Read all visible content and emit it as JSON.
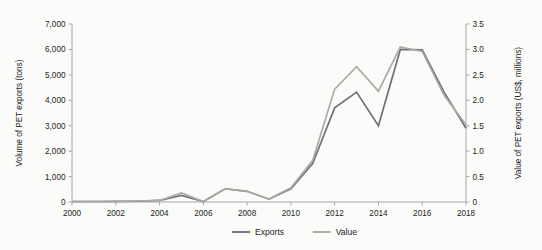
{
  "chart_data": {
    "type": "line",
    "title": "",
    "subtitle": "",
    "xlabel": "",
    "ylabel": "Volume of PET exports (tons)",
    "y2label": "Value of PET exports (US$, millions)",
    "grid": false,
    "legend_position": "bottom-center",
    "xlim": [
      2000,
      2018
    ],
    "ylim": [
      0,
      7000
    ],
    "y2lim": [
      0,
      3.5
    ],
    "x": [
      2000,
      2001,
      2002,
      2003,
      2004,
      2005,
      2006,
      2007,
      2008,
      2009,
      2010,
      2011,
      2012,
      2013,
      2014,
      2015,
      2016,
      2017,
      2018
    ],
    "xticks": [
      "2000",
      "2002",
      "2004",
      "2006",
      "2008",
      "2010",
      "2012",
      "2014",
      "2016",
      "2018"
    ],
    "xtick_values": [
      2000,
      2002,
      2004,
      2006,
      2008,
      2010,
      2012,
      2014,
      2016,
      2018
    ],
    "yticks": [
      "0",
      "1,000",
      "2,000",
      "3,000",
      "4,000",
      "5,000",
      "6,000",
      "7,000"
    ],
    "ytick_values": [
      0,
      1000,
      2000,
      3000,
      4000,
      5000,
      6000,
      7000
    ],
    "y2ticks": [
      "0",
      "0.5",
      "1.0",
      "1.5",
      "2.0",
      "2.5",
      "3.0",
      "3.5"
    ],
    "y2tick_values": [
      0,
      0.5,
      1.0,
      1.5,
      2.0,
      2.5,
      3.0,
      3.5
    ],
    "series": [
      {
        "name": "Exports",
        "axis": "left",
        "color": "#6d7278",
        "unit": "tons",
        "values": [
          20,
          20,
          25,
          30,
          60,
          260,
          20,
          520,
          420,
          110,
          520,
          1520,
          3700,
          4320,
          3000,
          6000,
          5980,
          4320,
          2900
        ]
      },
      {
        "name": "Value",
        "axis": "right",
        "color": "#a9aca4",
        "unit": "US$ millions",
        "values": [
          0.01,
          0.01,
          0.01,
          0.02,
          0.03,
          0.18,
          0.01,
          0.26,
          0.21,
          0.06,
          0.28,
          0.82,
          2.22,
          2.66,
          2.18,
          3.05,
          2.96,
          2.1,
          1.52
        ]
      }
    ]
  },
  "legend": {
    "items": [
      {
        "label": "Exports",
        "color": "#6d7278"
      },
      {
        "label": "Value",
        "color": "#a9aca4"
      }
    ]
  },
  "colors": {
    "exports": "#6d7278",
    "value": "#a9aca4",
    "axis": "#a7a9ac",
    "text": "#231f20",
    "background": "#fbfbfa"
  }
}
